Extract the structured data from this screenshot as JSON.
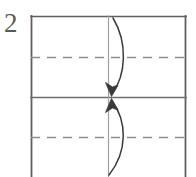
{
  "diagram": {
    "kind": "origami-fold-instruction",
    "step_number": "2",
    "canvas": {
      "width": 196,
      "height": 177,
      "background": "#ffffff"
    },
    "colors": {
      "solid_line": "#5f5f5f",
      "dashed_line": "#8e8e8e",
      "center_crease": "#9a9a9a",
      "arrow": "#3a3a3a",
      "step_number": "#5a5a5a"
    },
    "paper": {
      "label": "paper-outline",
      "left": 31,
      "top": 16,
      "right": 186,
      "bottom": 177,
      "note": "bottom edge runs off the frame"
    },
    "lines": [
      {
        "name": "paper-top-edge",
        "style": "solid",
        "orientation": "horizontal",
        "y": 16,
        "x1": 31,
        "x2": 186
      },
      {
        "name": "paper-left-edge",
        "style": "solid",
        "orientation": "vertical",
        "x": 31,
        "y1": 16,
        "y2": 177
      },
      {
        "name": "paper-right-edge",
        "style": "solid",
        "orientation": "vertical",
        "x": 186,
        "y1": 16,
        "y2": 177
      },
      {
        "name": "horizontal-midline-crease",
        "style": "solid",
        "orientation": "horizontal",
        "y": 97,
        "x1": 31,
        "x2": 186
      },
      {
        "name": "vertical-center-crease",
        "style": "solid",
        "orientation": "vertical",
        "x": 108,
        "y1": 16,
        "y2": 177
      },
      {
        "name": "upper-quarter-fold-line",
        "style": "dashed",
        "orientation": "horizontal",
        "y": 57,
        "x1": 31,
        "x2": 186
      },
      {
        "name": "lower-quarter-fold-line",
        "style": "dashed",
        "orientation": "horizontal",
        "y": 137,
        "x1": 31,
        "x2": 186
      }
    ],
    "arrows": [
      {
        "name": "fold-down-arrow",
        "direction": "down",
        "description": "top edge folds down to the horizontal midline",
        "path": "M 113 18 C 127 42 126 74 112 94",
        "head_tip": [
          111,
          96
        ],
        "head_left": [
          105,
          83
        ],
        "head_right": [
          118,
          86
        ]
      },
      {
        "name": "fold-up-arrow",
        "direction": "up",
        "description": "bottom edge folds up to the horizontal midline",
        "path": "M 110 174 C 127 152 126 122 112 101",
        "head_tip": [
          111,
          99
        ],
        "head_left": [
          105,
          112
        ],
        "head_right": [
          118,
          109
        ]
      }
    ]
  }
}
